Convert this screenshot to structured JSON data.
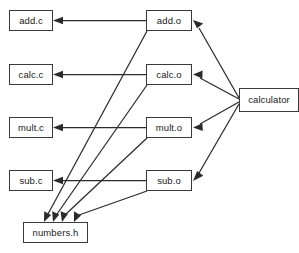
{
  "diagram": {
    "background_color": "#ffffff",
    "line_color": "#2b2b2b",
    "box_border_color": "#3a3a3a",
    "box_fill_color": "#ffffff",
    "nodes": [
      {
        "id": "add_c",
        "label": "add.c",
        "x": 9,
        "y": 10,
        "w": 44,
        "h": 21
      },
      {
        "id": "add_o",
        "label": "add.o",
        "x": 146,
        "y": 10,
        "w": 46,
        "h": 21
      },
      {
        "id": "calc_c",
        "label": "calc.c",
        "x": 9,
        "y": 64,
        "w": 44,
        "h": 21
      },
      {
        "id": "calc_o",
        "label": "calc.o",
        "x": 146,
        "y": 64,
        "w": 46,
        "h": 21
      },
      {
        "id": "mult_c",
        "label": "mult.c",
        "x": 9,
        "y": 117,
        "w": 44,
        "h": 21
      },
      {
        "id": "mult_o",
        "label": "mult.o",
        "x": 146,
        "y": 117,
        "w": 46,
        "h": 21
      },
      {
        "id": "sub_c",
        "label": "sub.c",
        "x": 9,
        "y": 170,
        "w": 44,
        "h": 21
      },
      {
        "id": "sub_o",
        "label": "sub.o",
        "x": 146,
        "y": 170,
        "w": 46,
        "h": 21
      },
      {
        "id": "numbers_h",
        "label": "numbers.h",
        "x": 23,
        "y": 222,
        "w": 65,
        "h": 21
      },
      {
        "id": "calculator",
        "label": "calculator",
        "x": 239,
        "y": 88,
        "w": 60,
        "h": 24
      }
    ],
    "edges": [
      {
        "id": "add_o-to-add_c",
        "from": "add_o",
        "to": "add_c",
        "kind": "horizontal"
      },
      {
        "id": "calc_o-to-calc_c",
        "from": "calc_o",
        "to": "calc_c",
        "kind": "horizontal"
      },
      {
        "id": "mult_o-to-mult_c",
        "from": "mult_o",
        "to": "mult_c",
        "kind": "horizontal"
      },
      {
        "id": "sub_o-to-sub_c",
        "from": "sub_o",
        "to": "sub_c",
        "kind": "horizontal"
      },
      {
        "id": "add_o-to-numbers_h",
        "from": "add_o",
        "to": "numbers_h",
        "kind": "diagonal"
      },
      {
        "id": "calc_o-to-numbers_h",
        "from": "calc_o",
        "to": "numbers_h",
        "kind": "diagonal"
      },
      {
        "id": "mult_o-to-numbers_h",
        "from": "mult_o",
        "to": "numbers_h",
        "kind": "diagonal"
      },
      {
        "id": "sub_o-to-numbers_h",
        "from": "sub_o",
        "to": "numbers_h",
        "kind": "diagonal"
      },
      {
        "id": "calculator-to-add_o",
        "from": "calculator",
        "to": "add_o",
        "kind": "fan"
      },
      {
        "id": "calculator-to-calc_o",
        "from": "calculator",
        "to": "calc_o",
        "kind": "fan"
      },
      {
        "id": "calculator-to-mult_o",
        "from": "calculator",
        "to": "mult_o",
        "kind": "fan"
      },
      {
        "id": "calculator-to-sub_o",
        "from": "calculator",
        "to": "sub_o",
        "kind": "fan"
      }
    ]
  }
}
